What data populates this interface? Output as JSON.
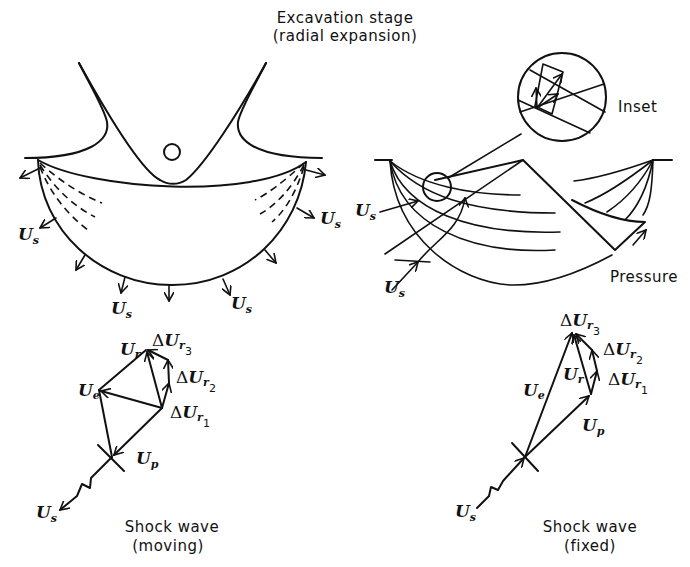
{
  "title": {
    "line1": "Excavation stage",
    "line2": "(radial expansion)"
  },
  "left_crater": {
    "labels": {
      "us_left": "U",
      "us_left_sub": "s",
      "us_right": "U",
      "us_right_sub": "s",
      "us_bottom_left": "U",
      "us_bottom_left_sub": "s",
      "us_bottom_right": "U",
      "us_bottom_right_sub": "s"
    }
  },
  "right_crater": {
    "inset_label": "Inset",
    "pressure_label": "Pressure",
    "labels": {
      "us_upper": "U",
      "us_upper_sub": "s",
      "us_lower": "U",
      "us_lower_sub": "s"
    }
  },
  "vector_moving": {
    "caption_line1": "Shock wave",
    "caption_line2": "(moving)",
    "labels": {
      "ur": "U",
      "ur_sub": "r",
      "ue": "U",
      "ue_sub": "e",
      "up": "U",
      "up_sub": "p",
      "us": "U",
      "us_sub": "s",
      "dur1_delta": "Δ",
      "dur1": "U",
      "dur1_sub": "r",
      "dur1_idx": "1",
      "dur2_delta": "Δ",
      "dur2": "U",
      "dur2_sub": "r",
      "dur2_idx": "2",
      "dur3_delta": "Δ",
      "dur3": "U",
      "dur3_sub": "r",
      "dur3_idx": "3"
    }
  },
  "vector_fixed": {
    "caption_line1": "Shock wave",
    "caption_line2": "(fixed)",
    "labels": {
      "ur": "U",
      "ur_sub": "r",
      "ue": "U",
      "ue_sub": "e",
      "up": "U",
      "up_sub": "p",
      "us": "U",
      "us_sub": "s",
      "dur1_delta": "Δ",
      "dur1": "U",
      "dur1_sub": "r",
      "dur1_idx": "1",
      "dur2_delta": "Δ",
      "dur2": "U",
      "dur2_sub": "r",
      "dur2_idx": "2",
      "dur3_delta": "Δ",
      "dur3": "U",
      "dur3_sub": "r",
      "dur3_idx": "3"
    }
  }
}
